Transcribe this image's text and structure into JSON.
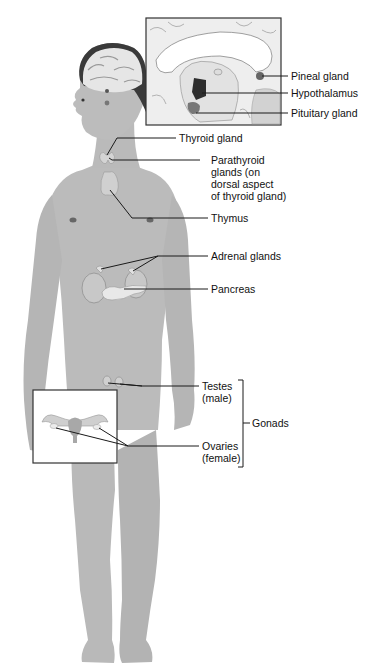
{
  "figure": {
    "colors": {
      "background": "#ffffff",
      "skin": "#b9b9b9",
      "skin_shadow": "#a5a5a5",
      "gland": "#d4d4d4",
      "hair_dark": "#3a3a3a",
      "brain": "#e6e6e6",
      "leader_line": "#1a1a1a",
      "inset_border": "#333333",
      "text": "#111111"
    },
    "insets": [
      {
        "name": "brain-sagittal-inset",
        "depicts": "midsagittal section of brain"
      },
      {
        "name": "female-reproductive-inset",
        "depicts": "uterus with ovaries"
      }
    ],
    "labels": {
      "pineal": "Pineal gland",
      "hypothalamus": "Hypothalamus",
      "pituitary": "Pituitary gland",
      "thyroid": "Thyroid gland",
      "parathyroid": "Parathyroid\nglands (on\ndorsal aspect\nof thyroid gland)",
      "thymus": "Thymus",
      "adrenal": "Adrenal glands",
      "pancreas": "Pancreas",
      "testes": "Testes\n(male)",
      "gonads": "Gonads",
      "ovaries": "Ovaries\n(female)"
    }
  }
}
